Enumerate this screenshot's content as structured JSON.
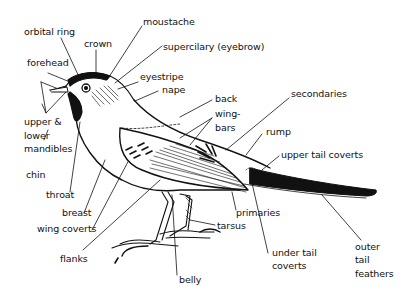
{
  "diagram": {
    "type": "labeled anatomical illustration",
    "labels": [
      {
        "id": "orbital_ring",
        "text": "orbital ring"
      },
      {
        "id": "crown",
        "text": "crown"
      },
      {
        "id": "moustache",
        "text": "moustache"
      },
      {
        "id": "supercilary",
        "text": "supercilary (eyebrow)"
      },
      {
        "id": "forehead",
        "text": "forehead"
      },
      {
        "id": "eyestripe",
        "text": "eyestripe"
      },
      {
        "id": "nape",
        "text": "nape"
      },
      {
        "id": "mandibles_1",
        "text": "upper &"
      },
      {
        "id": "mandibles_2",
        "text": "lower"
      },
      {
        "id": "mandibles_3",
        "text": "mandibles"
      },
      {
        "id": "chin",
        "text": "chin"
      },
      {
        "id": "throat",
        "text": "throat"
      },
      {
        "id": "breast",
        "text": "breast"
      },
      {
        "id": "wing_coverts",
        "text": "wing coverts"
      },
      {
        "id": "flanks",
        "text": "flanks"
      },
      {
        "id": "belly",
        "text": "belly"
      },
      {
        "id": "back",
        "text": "back"
      },
      {
        "id": "wingbars_1",
        "text": "wing-"
      },
      {
        "id": "wingbars_2",
        "text": "bars"
      },
      {
        "id": "secondaries",
        "text": "secondaries"
      },
      {
        "id": "rump",
        "text": "rump"
      },
      {
        "id": "upper_tail_coverts",
        "text": "upper tail coverts"
      },
      {
        "id": "primaries",
        "text": "primaries"
      },
      {
        "id": "tarsus",
        "text": "tarsus"
      },
      {
        "id": "under_tail_coverts_1",
        "text": "under tail"
      },
      {
        "id": "under_tail_coverts_2",
        "text": "coverts"
      },
      {
        "id": "outer_tail_feathers_1",
        "text": "outer"
      },
      {
        "id": "outer_tail_feathers_2",
        "text": "tail"
      },
      {
        "id": "outer_tail_feathers_3",
        "text": "feathers"
      }
    ]
  },
  "colors": {
    "ink": "#111111",
    "background": "#ffffff"
  }
}
